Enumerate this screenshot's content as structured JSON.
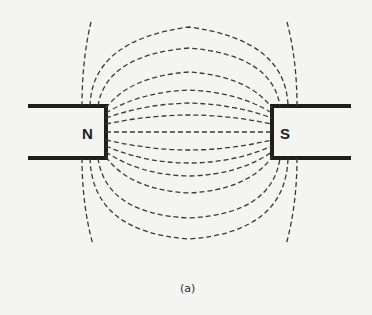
{
  "figure": {
    "north_label": "N",
    "south_label": "S",
    "caption": "(a)"
  },
  "colors": {
    "background": "#f4f4f2",
    "ink": "#1e1e1e",
    "field_lines": "#3a3a3a"
  }
}
